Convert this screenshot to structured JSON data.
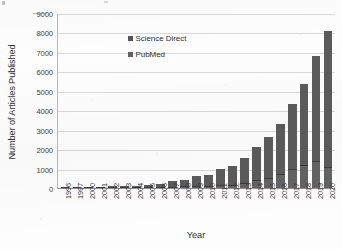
{
  "chart_data": {
    "type": "bar",
    "subtype": "stacked-vertical-bar",
    "title": "",
    "xlabel": "Year",
    "ylabel": "Number of Articles Published",
    "ylim": [
      0,
      9000
    ],
    "ytick_step": 1000,
    "yticks": [
      "0",
      "1000",
      "2000",
      "3000",
      "4000",
      "5000",
      "6000",
      "7000",
      "8000",
      "9000"
    ],
    "grid": "horizontal",
    "legend_position": "upper-left-inside",
    "categories": [
      "1996",
      "1997",
      "2000",
      "2001",
      "2002",
      "2003",
      "2004",
      "2005",
      "2006",
      "2007",
      "2008",
      "2009",
      "2010",
      "2011",
      "2012",
      "2013",
      "2014",
      "2015",
      "2016",
      "2017",
      "2018",
      "2019",
      "2020"
    ],
    "series": [
      {
        "name": "Science Direct",
        "color": "#5b5b5b",
        "values": [
          10,
          15,
          20,
          25,
          30,
          35,
          70,
          120,
          150,
          300,
          320,
          500,
          560,
          840,
          960,
          1300,
          1720,
          2100,
          2600,
          3340,
          4140,
          5400,
          7000
        ]
      },
      {
        "name": "PubMed",
        "color": "#636363",
        "values": [
          5,
          5,
          10,
          10,
          10,
          15,
          30,
          40,
          50,
          60,
          80,
          100,
          110,
          140,
          180,
          260,
          390,
          510,
          710,
          960,
          1190,
          1400,
          1100
        ]
      }
    ],
    "totals": [
      15,
      20,
      30,
      35,
      40,
      50,
      100,
      160,
      200,
      360,
      400,
      600,
      670,
      980,
      1140,
      1560,
      2110,
      2610,
      3310,
      4300,
      5330,
      6800,
      8100
    ]
  },
  "legend": {
    "entries": [
      {
        "label": "Science Direct",
        "swatch": "science-direct-swatch"
      },
      {
        "label": "PubMed",
        "swatch": "pubmed-swatch"
      }
    ]
  }
}
